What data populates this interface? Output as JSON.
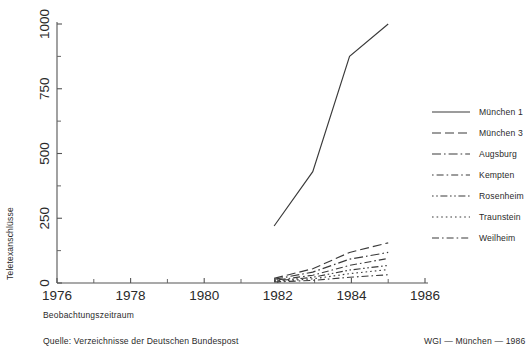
{
  "chart_data": {
    "type": "line",
    "title": "",
    "xlabel": "Beobachtungszeitraum",
    "ylabel": "Teletexanschlüsse",
    "xlim": [
      1976,
      1986
    ],
    "ylim": [
      0,
      1000
    ],
    "xticks": [
      1976,
      1978,
      1980,
      1982,
      1984,
      1986
    ],
    "xticklabels": [
      "1976",
      "1978",
      "1980",
      "1982",
      "1984",
      "1986"
    ],
    "yticks": [
      0,
      250,
      500,
      750,
      1000
    ],
    "yticklabels": [
      "0",
      "250",
      "500",
      "750",
      "1000"
    ],
    "minor_xticks": [
      1977,
      1979,
      1981,
      1983,
      1985
    ],
    "minor_yticks": [
      125,
      375,
      625,
      875
    ],
    "grid": false,
    "legend_position": "right",
    "series": [
      {
        "name": "München 1",
        "style": "solid",
        "x": [
          1981.9,
          1982.95,
          1983.95,
          1985.0
        ],
        "values": [
          220,
          430,
          875,
          1000
        ]
      },
      {
        "name": "München 3",
        "style": "long-dash",
        "x": [
          1981.9,
          1982.95,
          1983.95,
          1985.0
        ],
        "values": [
          18,
          55,
          118,
          155
        ]
      },
      {
        "name": "Augsburg",
        "style": "dash-dot-dash",
        "x": [
          1981.9,
          1982.95,
          1983.95,
          1985.0
        ],
        "values": [
          14,
          42,
          92,
          118
        ]
      },
      {
        "name": "Kempten",
        "style": "dot-dash-dot",
        "x": [
          1981.9,
          1982.95,
          1983.95,
          1985.0
        ],
        "values": [
          10,
          30,
          68,
          95
        ]
      },
      {
        "name": "Rosenheim",
        "style": "dot-dot-dash",
        "x": [
          1981.9,
          1982.95,
          1983.95,
          1985.0
        ],
        "values": [
          8,
          22,
          50,
          68
        ]
      },
      {
        "name": "Traunstein",
        "style": "dotted",
        "x": [
          1981.9,
          1982.95,
          1983.95,
          1985.0
        ],
        "values": [
          6,
          16,
          36,
          52
        ]
      },
      {
        "name": "Weilheim",
        "style": "dash-dot",
        "x": [
          1981.9,
          1982.95,
          1983.95,
          1985.0
        ],
        "values": [
          4,
          10,
          22,
          32
        ]
      }
    ]
  },
  "legend": {
    "items": [
      {
        "label": "München 1",
        "style": "solid"
      },
      {
        "label": "München 3",
        "style": "long-dash"
      },
      {
        "label": "Augsburg",
        "style": "dash-dot-dash"
      },
      {
        "label": "Kempten",
        "style": "dot-dash-dot"
      },
      {
        "label": "Rosenheim",
        "style": "dot-dot-dash"
      },
      {
        "label": "Traunstein",
        "style": "dotted"
      },
      {
        "label": "Weilheim",
        "style": "dash-dot"
      }
    ]
  },
  "footer": {
    "source": "Quelle: Verzeichnisse der Deutschen Bundespost",
    "attribution": "WGI — München — 1986"
  },
  "colors": {
    "line": "#3a3a3a",
    "axis": "#555555",
    "text": "#2a2a2a",
    "background": "#ffffff"
  }
}
